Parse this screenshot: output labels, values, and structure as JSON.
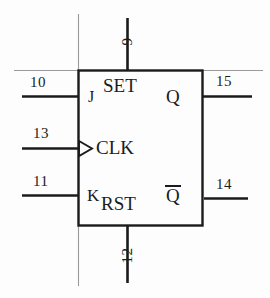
{
  "diagram": {
    "kind": "logic-symbol",
    "ink_color": "#1b1b1b",
    "background_color": "#fdfdfd",
    "ports": {
      "j": "J",
      "set": "SET",
      "clk": "CLK",
      "k": "K",
      "rst": "RST",
      "q": "Q",
      "qbar": "Q"
    },
    "pins": {
      "set_top": "9",
      "j_left": "10",
      "clk_left": "13",
      "k_left": "11",
      "rst_bottom": "12",
      "q_right": "15",
      "qbar_right": "14"
    }
  }
}
